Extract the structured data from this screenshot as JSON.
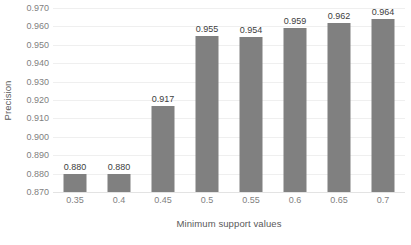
{
  "chart_data": {
    "type": "bar",
    "title": "",
    "subtitle": "",
    "xlabel": "Minimum support values",
    "ylabel": "Precision",
    "categories": [
      "0.35",
      "0.4",
      "0.45",
      "0.5",
      "0.55",
      "0.6",
      "0.65",
      "0.7"
    ],
    "values": [
      0.88,
      0.88,
      0.917,
      0.955,
      0.954,
      0.959,
      0.962,
      0.964
    ],
    "data_labels": [
      "0.880",
      "0.880",
      "0.917",
      "0.955",
      "0.954",
      "0.959",
      "0.962",
      "0.964"
    ],
    "ylim": [
      0.87,
      0.97
    ],
    "ytick_labels": [
      "0.970",
      "0.960",
      "0.950",
      "0.940",
      "0.930",
      "0.920",
      "0.910",
      "0.900",
      "0.890",
      "0.880",
      "0.870"
    ],
    "ytick_values": [
      0.97,
      0.96,
      0.95,
      0.94,
      0.93,
      0.92,
      0.91,
      0.9,
      0.89,
      0.88,
      0.87
    ],
    "ytick_step": 0.01,
    "grid": true,
    "grid_axis": "y",
    "legend": false,
    "legend_position": "none",
    "series": [
      {
        "name": "Precision",
        "values": [
          0.88,
          0.88,
          0.917,
          0.955,
          0.954,
          0.959,
          0.962,
          0.964
        ],
        "color": "#808080"
      }
    ]
  },
  "style": {
    "bar_color": "#808080",
    "gridline_color": "#efefef",
    "baseline_color": "#e3e3e3",
    "tick_label_color": "#7f7f7f",
    "axis_title_color": "#595959",
    "data_label_color": "#404040",
    "background_color": "#ffffff"
  }
}
